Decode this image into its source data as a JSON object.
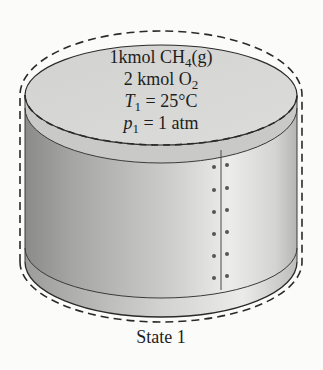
{
  "diagram": {
    "type": "closed-tank-system",
    "contents": {
      "line1": {
        "prefix": "1kmol CH",
        "sub": "4",
        "suffix": "(g)"
      },
      "line2": {
        "prefix": "2 kmol O",
        "sub": "2",
        "suffix": ""
      },
      "line3": {
        "var": "T",
        "sub": "1",
        "rest": " = 25°C"
      },
      "line4": {
        "var": "p",
        "sub": "1",
        "rest": " = 1 atm"
      }
    },
    "caption": "State 1",
    "boundary_style": "dashed",
    "colors": {
      "top_face": "#d6d6d4",
      "side_dark": "#8f8f8d",
      "side_light": "#e9e9e7",
      "outline": "#2a2a2a",
      "rivet": "#4a4a4a"
    }
  }
}
